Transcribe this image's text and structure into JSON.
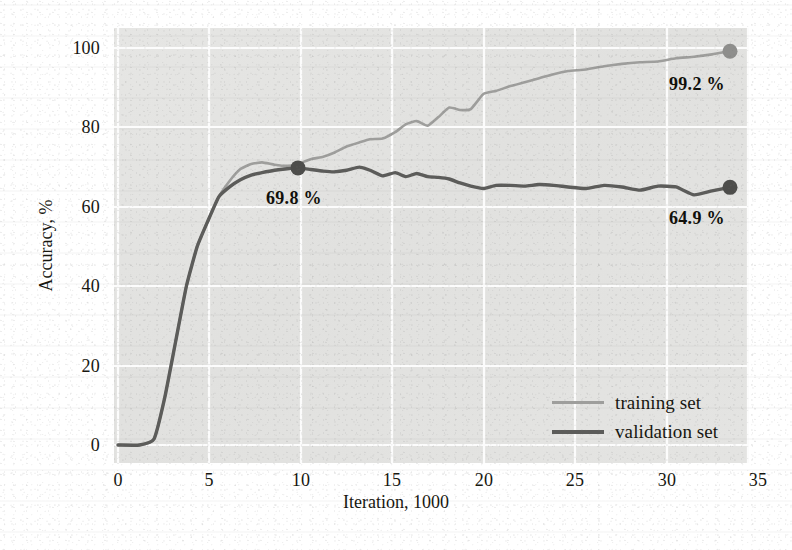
{
  "chart_data": {
    "type": "line",
    "title": "",
    "xlabel": "Iteration, 1000",
    "ylabel": "Accuracy, %",
    "xlim": [
      0,
      35
    ],
    "ylim": [
      0,
      100
    ],
    "xticks": [
      0,
      5,
      10,
      15,
      20,
      25,
      30,
      35
    ],
    "yticks": [
      0,
      20,
      40,
      60,
      80,
      100
    ],
    "xtick_labels": [
      "0",
      "5",
      "10",
      "15",
      "20",
      "25",
      "30",
      "35"
    ],
    "ytick_labels": [
      "0",
      "20",
      "40",
      "60",
      "80",
      "100"
    ],
    "grid": true,
    "legend_position": "lower right inside axes",
    "plot_background": "#e3e3e1",
    "gridline_color": "#ffffff",
    "series": [
      {
        "name": "training set",
        "color": "#9e9e9c",
        "line_width": 2.6,
        "end_marker": {
          "x": 34,
          "y": 99.2,
          "label": "99.2 %",
          "color": "#8e8e8c"
        },
        "x": [
          0.0,
          1.2,
          2.0,
          2.6,
          3.2,
          3.8,
          4.4,
          5.0,
          5.6,
          6.2,
          6.8,
          7.4,
          8.0,
          8.7,
          9.4,
          10.0,
          10.7,
          11.4,
          12.0,
          12.7,
          13.4,
          14.0,
          14.7,
          15.4,
          16.0,
          16.6,
          17.2,
          17.8,
          18.4,
          19.0,
          19.6,
          20.3,
          21.0,
          21.8,
          22.6,
          23.4,
          24.2,
          25.0,
          26.0,
          27.0,
          28.0,
          29.0,
          30.0,
          31.0,
          32.0,
          33.0,
          34.0
        ],
        "y": [
          0.0,
          0.0,
          1.5,
          12.0,
          26.0,
          40.0,
          50.0,
          56.5,
          62.5,
          66.5,
          69.5,
          70.8,
          71.2,
          70.6,
          70.3,
          70.8,
          72.0,
          72.6,
          73.6,
          75.2,
          76.2,
          77.0,
          77.2,
          78.8,
          80.8,
          81.6,
          80.4,
          82.6,
          85.0,
          84.4,
          84.6,
          88.4,
          89.2,
          90.4,
          91.4,
          92.4,
          93.4,
          94.2,
          94.6,
          95.4,
          96.0,
          96.4,
          96.6,
          97.4,
          97.8,
          98.4,
          99.2
        ]
      },
      {
        "name": "validation set",
        "color": "#5c5c5a",
        "line_width": 3.4,
        "mid_marker": {
          "x": 10,
          "y": 69.8,
          "label": "69.8 %",
          "color": "#4e4e4c"
        },
        "end_marker": {
          "x": 34,
          "y": 64.9,
          "label": "64.9 %",
          "color": "#4e4e4c"
        },
        "x": [
          0.0,
          1.2,
          2.0,
          2.6,
          3.2,
          3.8,
          4.4,
          5.0,
          5.6,
          6.2,
          6.8,
          7.4,
          8.0,
          8.7,
          9.4,
          10.0,
          10.7,
          11.4,
          12.0,
          12.7,
          13.4,
          14.0,
          14.7,
          15.4,
          16.0,
          16.6,
          17.2,
          17.8,
          18.4,
          19.0,
          19.6,
          20.3,
          21.0,
          21.8,
          22.6,
          23.4,
          24.2,
          25.0,
          26.0,
          27.0,
          28.0,
          29.0,
          30.0,
          31.0,
          32.0,
          33.0,
          34.0
        ],
        "y": [
          0.0,
          0.0,
          1.5,
          12.0,
          26.0,
          40.0,
          50.0,
          56.5,
          62.5,
          65.0,
          66.8,
          68.0,
          68.6,
          69.2,
          69.6,
          69.8,
          69.4,
          69.0,
          68.8,
          69.2,
          70.0,
          69.2,
          67.8,
          68.6,
          67.6,
          68.4,
          67.6,
          67.4,
          67.0,
          66.0,
          65.2,
          64.6,
          65.4,
          65.4,
          65.2,
          65.6,
          65.4,
          65.0,
          64.6,
          65.4,
          65.0,
          64.2,
          65.2,
          65.0,
          63.0,
          64.0,
          64.9
        ]
      }
    ],
    "annotations": [
      {
        "text": "99.2 %",
        "at_x": 34,
        "at_y": 99.2,
        "series": "training set"
      },
      {
        "text": "69.8 %",
        "at_x": 10,
        "at_y": 69.8,
        "series": "validation set"
      },
      {
        "text": "64.9 %",
        "at_x": 34,
        "at_y": 64.9,
        "series": "validation set"
      }
    ]
  },
  "legend": {
    "items": [
      {
        "label": "training set"
      },
      {
        "label": "validation set"
      }
    ]
  }
}
